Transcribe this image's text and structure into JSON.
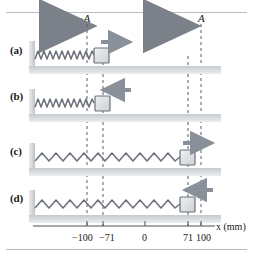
{
  "figure": {
    "title": "",
    "amplitude_labels": {
      "left": "−A",
      "right": "A"
    },
    "axis": {
      "label": "x (mm)",
      "ticks": [
        {
          "value": -100,
          "label": "−100"
        },
        {
          "value": -71,
          "label": "−71"
        },
        {
          "value": 0,
          "label": "0"
        },
        {
          "value": 71,
          "label": "71"
        },
        {
          "value": 100,
          "label": "100"
        }
      ]
    },
    "rows": [
      {
        "label": "(a)",
        "position_mm": -100,
        "spring_state": "compressed",
        "arrow_direction": "right"
      },
      {
        "label": "(b)",
        "position_mm": -71,
        "spring_state": "compressed",
        "arrow_direction": "left"
      },
      {
        "label": "(c)",
        "position_mm": 71,
        "spring_state": "stretched",
        "arrow_direction": "right"
      },
      {
        "label": "(d)",
        "position_mm": 71,
        "spring_state": "stretched",
        "arrow_direction": "left"
      }
    ],
    "colors": {
      "spring": "#6b7078",
      "block_fill": "#dcdee1",
      "block_stroke": "#6b7078",
      "arrow": "#8a9099",
      "dashed_line": "#5a5f66",
      "ground": "#d2d5d9",
      "wall": "#d2d5d9",
      "axis": "#4a4f55",
      "rule": "#b9bcc0",
      "text": "#1a1a1a"
    }
  }
}
